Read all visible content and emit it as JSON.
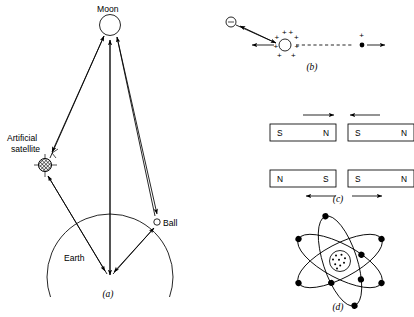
{
  "figure": {
    "background_color": "#ffffff",
    "ink_color": "#000000",
    "panels": [
      {
        "id": "a",
        "label": "(a)",
        "caption_x": 108,
        "caption_y": 297,
        "subject": "gravitational-attraction-earth-moon-satellite-ball",
        "labels": [
          {
            "name": "moon-label",
            "text": "Moon",
            "x": 97,
            "y": 12,
            "anchor": "start"
          },
          {
            "name": "artificial-satellite-label-line1",
            "text": "Artificial",
            "x": 7,
            "y": 141,
            "anchor": "start"
          },
          {
            "name": "artificial-satellite-label-line2",
            "text": "satellite",
            "x": 11,
            "y": 152,
            "anchor": "start"
          },
          {
            "name": "ball-label",
            "text": "Ball",
            "x": 163,
            "y": 226,
            "anchor": "start"
          },
          {
            "name": "earth-label",
            "text": "Earth",
            "x": 64,
            "y": 261,
            "anchor": "start"
          }
        ],
        "bodies": {
          "moon": {
            "cx": 110,
            "cy": 25,
            "r": 10.5
          },
          "satellite": {
            "cx": 45,
            "cy": 165,
            "r": 6.5
          },
          "ball": {
            "cx": 157,
            "cy": 222,
            "r": 3.2
          },
          "earth_center": {
            "cx": 110,
            "cy": 277
          },
          "earth_arc_radius": 63
        }
      },
      {
        "id": "b",
        "label": "(b)",
        "caption_x": 312,
        "caption_y": 70,
        "subject": "electric-forces-between-charges",
        "charges": [
          {
            "name": "negative-charge",
            "sign": "−",
            "cx": 231,
            "cy": 22,
            "r": 5.0,
            "style": "open"
          },
          {
            "name": "positive-charge-large",
            "sign": "+",
            "cx": 285,
            "cy": 45,
            "r": 6.0,
            "style": "open-with-plus-halo"
          },
          {
            "name": "positive-charge-point",
            "sign": "+",
            "cx": 362,
            "cy": 45,
            "r": 2.4,
            "style": "filled"
          }
        ],
        "plus_halo_count": 8
      },
      {
        "id": "c",
        "label": "(c)",
        "caption_x": 338,
        "caption_y": 202,
        "subject": "magnetic-forces-between-bar-magnets",
        "magnets": [
          {
            "name": "magnet-top-left",
            "x": 270,
            "y": 124,
            "w": 66,
            "h": 17,
            "left_pole": "S",
            "right_pole": "N",
            "force_arrow": {
              "direction": "right",
              "position": "above",
              "x1": 303,
              "x2": 334,
              "y": 115
            }
          },
          {
            "name": "magnet-top-right",
            "x": 348,
            "y": 124,
            "w": 66,
            "h": 17,
            "left_pole": "S",
            "right_pole": "N",
            "force_arrow": {
              "direction": "left",
              "position": "above",
              "x1": 380,
              "x2": 350,
              "y": 115
            }
          },
          {
            "name": "magnet-bottom-left",
            "x": 270,
            "y": 170,
            "w": 66,
            "h": 17,
            "left_pole": "N",
            "right_pole": "S",
            "force_arrow": {
              "direction": "left",
              "position": "below",
              "x1": 336,
              "x2": 306,
              "y": 196
            }
          },
          {
            "name": "magnet-bottom-right",
            "x": 348,
            "y": 170,
            "w": 66,
            "h": 17,
            "left_pole": "S",
            "right_pole": "N",
            "force_arrow": {
              "direction": "right",
              "position": "below",
              "x1": 352,
              "x2": 382,
              "y": 196
            }
          }
        ]
      },
      {
        "id": "d",
        "label": "(d)",
        "caption_x": 338,
        "caption_y": 310,
        "subject": "bohr-atom-model-nucleus-and-orbiting-electrons",
        "nucleus": {
          "cx": 340,
          "cy": 261,
          "r": 10.5,
          "proton_dots": 9
        },
        "orbits": [
          {
            "name": "orbit-1",
            "rx": 47,
            "ry": 17,
            "rotation": 28
          },
          {
            "name": "orbit-2",
            "rx": 47,
            "ry": 17,
            "rotation": -28
          },
          {
            "name": "orbit-3",
            "rx": 47,
            "ry": 17,
            "rotation": 72
          }
        ],
        "electron_count": 9,
        "electron_radius": 3.1
      }
    ]
  }
}
